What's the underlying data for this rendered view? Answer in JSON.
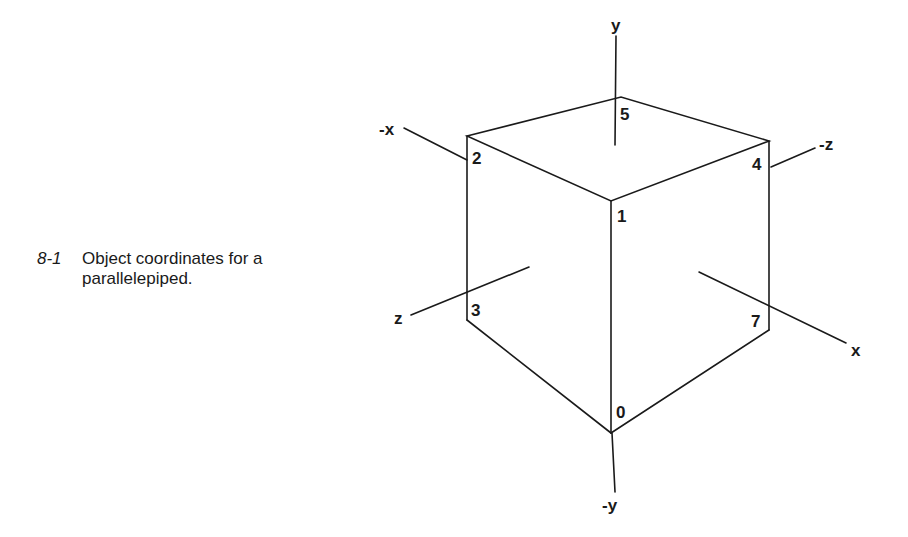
{
  "caption": {
    "number": "8-1",
    "text": "Object coordinates for a parallelepiped."
  },
  "figure": {
    "axes": {
      "y": "y",
      "neg_y": "-y",
      "x": "x",
      "neg_x": "-x",
      "z": "z",
      "neg_z": "-z"
    },
    "vertices": {
      "v0": "0",
      "v1": "1",
      "v2": "2",
      "v3": "3",
      "v4": "4",
      "v5": "5",
      "v7": "7"
    }
  }
}
